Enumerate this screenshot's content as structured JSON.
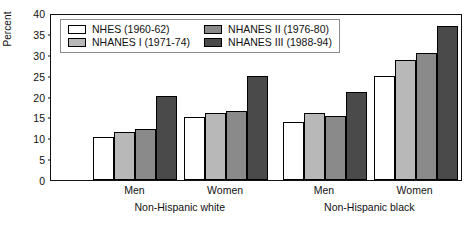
{
  "chart_data": {
    "type": "bar",
    "title": "",
    "xlabel": "",
    "ylabel": "Percent",
    "ylim": [
      0,
      40
    ],
    "yticks": [
      0,
      5,
      10,
      15,
      20,
      25,
      30,
      35,
      40
    ],
    "grid": false,
    "legend_position": "top-left-inside",
    "categories": [
      "Men",
      "Women",
      "Men",
      "Women"
    ],
    "group_labels": [
      "Non-Hispanic white",
      "Non-Hispanic black"
    ],
    "series": [
      {
        "name": "NHES (1960-62)",
        "color": "#ffffff",
        "values": [
          10.2,
          15.0,
          13.9,
          25.0
        ]
      },
      {
        "name": "NHANES I (1971-74)",
        "color": "#b8b8b8",
        "values": [
          11.6,
          16.0,
          16.0,
          28.7
        ]
      },
      {
        "name": "NHANES II (1976-80)",
        "color": "#8a8a8a",
        "values": [
          12.2,
          16.5,
          15.3,
          30.5
        ]
      },
      {
        "name": "NHANES III (1988-94)",
        "color": "#4a4a4a",
        "values": [
          20.1,
          25.0,
          21.0,
          37.0
        ]
      }
    ]
  },
  "legend": {
    "items": [
      {
        "label": "NHES (1960-62)",
        "swatch": "white-swatch"
      },
      {
        "label": "NHANES II (1976-80)",
        "swatch": "medium-gray-swatch"
      },
      {
        "label": "NHANES I (1971-74)",
        "swatch": "light-gray-swatch"
      },
      {
        "label": "NHANES III (1988-94)",
        "swatch": "dark-gray-swatch"
      }
    ]
  },
  "axes": {
    "y_title": "Percent",
    "y_tick_labels": [
      "40",
      "35",
      "30",
      "25",
      "20",
      "15",
      "10",
      "5",
      "0"
    ],
    "x_tick_labels": [
      "Men",
      "Women",
      "Men",
      "Women"
    ],
    "x_group_labels": [
      "Non-Hispanic white",
      "Non-Hispanic black"
    ]
  },
  "colors": {
    "series_0": "#ffffff",
    "series_1": "#b8b8b8",
    "series_2": "#8a8a8a",
    "series_3": "#4a4a4a",
    "axis": "#111111",
    "legend_border": "#8c8c8c"
  }
}
